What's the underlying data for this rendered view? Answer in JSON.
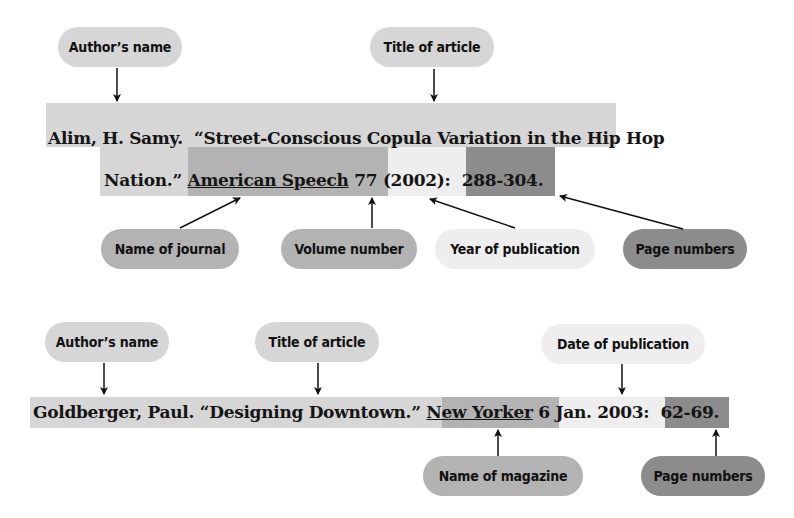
{
  "example1": {
    "labels": {
      "author": "Author’s name",
      "title": "Title of article",
      "journal": "Name of journal",
      "volume": "Volume number",
      "year": "Year of publication",
      "pages": "Page numbers"
    },
    "citation": {
      "author": "Alim, H. Samy.",
      "title_line1": "“Street-Conscious Copula Variation in the Hip Hop",
      "title_line2": "Nation.”",
      "journal": "American Speech",
      "volume": "77",
      "year": "(2002):",
      "pages": "288-304."
    }
  },
  "example2": {
    "labels": {
      "author": "Author’s name",
      "title": "Title of article",
      "date": "Date of publication",
      "magazine": "Name of magazine",
      "pages": "Page numbers"
    },
    "citation": {
      "author": "Goldberger, Paul.",
      "title": "“Designing Downtown.”",
      "magazine": "New Yorker",
      "date": "6 Jan. 2003:",
      "pages": "62-69."
    }
  },
  "colors": {
    "light": "#d6d6d6",
    "medium": "#b3b3b3",
    "very_light": "#eeeeee",
    "dark": "#8c8c8c"
  }
}
